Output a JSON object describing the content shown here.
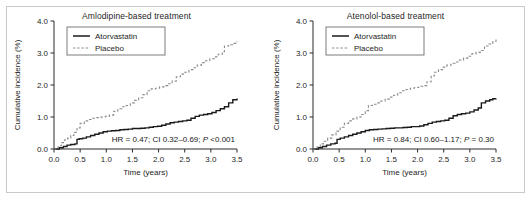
{
  "figure": {
    "border_color": "#c9c9c9",
    "background": "#ffffff"
  },
  "chart_data": [
    {
      "type": "line",
      "panel": "left",
      "title": "Amlodipine-based treatment",
      "xlabel": "Time (years)",
      "ylabel": "Cumulative incidence (%)",
      "xlim": [
        0.0,
        3.5
      ],
      "ylim": [
        0.0,
        4.0
      ],
      "xticks": [
        "0.0",
        "0.5",
        "1.0",
        "1.5",
        "2.0",
        "2.5",
        "3.0",
        "3.5"
      ],
      "yticks": [
        "0.0",
        "1.0",
        "2.0",
        "3.0",
        "4.0"
      ],
      "grid": false,
      "legend_position": "top-left",
      "annotation": "HR = 0.47; CI 0.32–0.69; P <0.001",
      "annotation_parts": {
        "pre": "HR = 0.47; CI 0.32–0.69; ",
        "italic": "P",
        "post": " <0.001"
      },
      "hazard_ratio": 0.47,
      "ci_low": 0.32,
      "ci_high": 0.69,
      "p_value": "<0.001",
      "series": [
        {
          "name": "Atorvastatin",
          "style": "solid",
          "color": "#1a1a1a",
          "x": [
            0.0,
            0.1,
            0.18,
            0.25,
            0.32,
            0.4,
            0.44,
            0.48,
            0.55,
            0.62,
            0.7,
            0.78,
            0.86,
            0.94,
            1.02,
            1.1,
            1.18,
            1.26,
            1.34,
            1.42,
            1.5,
            1.58,
            1.66,
            1.74,
            1.82,
            1.9,
            1.98,
            2.06,
            2.14,
            2.22,
            2.3,
            2.38,
            2.46,
            2.54,
            2.62,
            2.7,
            2.78,
            2.86,
            2.94,
            3.02,
            3.1,
            3.18,
            3.26,
            3.34,
            3.42,
            3.5
          ],
          "y": [
            0.0,
            0.04,
            0.08,
            0.12,
            0.14,
            0.16,
            0.3,
            0.32,
            0.34,
            0.38,
            0.42,
            0.46,
            0.5,
            0.54,
            0.56,
            0.57,
            0.58,
            0.6,
            0.61,
            0.62,
            0.64,
            0.64,
            0.65,
            0.66,
            0.68,
            0.7,
            0.71,
            0.74,
            0.78,
            0.82,
            0.84,
            0.86,
            0.88,
            0.9,
            0.96,
            1.02,
            1.06,
            1.08,
            1.1,
            1.14,
            1.2,
            1.26,
            1.32,
            1.44,
            1.54,
            1.58
          ]
        },
        {
          "name": "Placebo",
          "style": "dashed",
          "color": "#8c8c8c",
          "x": [
            0.0,
            0.08,
            0.14,
            0.2,
            0.26,
            0.32,
            0.38,
            0.44,
            0.5,
            0.58,
            0.66,
            0.74,
            0.82,
            0.9,
            0.98,
            1.06,
            1.14,
            1.22,
            1.3,
            1.38,
            1.46,
            1.54,
            1.62,
            1.7,
            1.78,
            1.86,
            1.94,
            2.02,
            2.1,
            2.18,
            2.26,
            2.34,
            2.42,
            2.5,
            2.58,
            2.66,
            2.74,
            2.82,
            2.9,
            2.98,
            3.06,
            3.14,
            3.22,
            3.26,
            3.34,
            3.42,
            3.5
          ],
          "y": [
            0.0,
            0.1,
            0.2,
            0.28,
            0.34,
            0.42,
            0.52,
            0.66,
            0.8,
            0.88,
            0.92,
            0.96,
            0.98,
            1.0,
            1.02,
            1.06,
            1.18,
            1.26,
            1.32,
            1.36,
            1.44,
            1.52,
            1.6,
            1.7,
            1.82,
            1.88,
            1.9,
            1.94,
            1.98,
            2.04,
            2.12,
            2.26,
            2.34,
            2.4,
            2.48,
            2.54,
            2.62,
            2.7,
            2.76,
            2.82,
            2.88,
            2.96,
            3.04,
            3.22,
            3.26,
            3.3,
            3.36
          ]
        }
      ]
    },
    {
      "type": "line",
      "panel": "right",
      "title": "Atenolol-based treatment",
      "xlabel": "Time (years)",
      "ylabel": "Cumulative incidence (%)",
      "xlim": [
        0.0,
        3.5
      ],
      "ylim": [
        0.0,
        4.0
      ],
      "xticks": [
        "0.0",
        "0.5",
        "1.0",
        "1.5",
        "2.0",
        "2.5",
        "3.0",
        "3.5"
      ],
      "yticks": [
        "0.0",
        "1.0",
        "2.0",
        "3.0",
        "4.0"
      ],
      "grid": false,
      "legend_position": "top-left",
      "annotation": "HR = 0.84; CI 0.60–1.17; P = 0.30",
      "annotation_parts": {
        "pre": "HR = 0.84; CI 0.60–1.17; ",
        "italic": "P",
        "post": " = 0.30"
      },
      "hazard_ratio": 0.84,
      "ci_low": 0.6,
      "ci_high": 1.17,
      "p_value": "0.30",
      "series": [
        {
          "name": "Atorvastatin",
          "style": "solid",
          "color": "#1a1a1a",
          "x": [
            0.0,
            0.1,
            0.18,
            0.26,
            0.34,
            0.42,
            0.46,
            0.52,
            0.6,
            0.68,
            0.76,
            0.84,
            0.92,
            1.0,
            1.08,
            1.16,
            1.24,
            1.32,
            1.4,
            1.48,
            1.56,
            1.64,
            1.72,
            1.8,
            1.88,
            1.96,
            2.04,
            2.12,
            2.2,
            2.28,
            2.36,
            2.44,
            2.52,
            2.6,
            2.68,
            2.76,
            2.84,
            2.92,
            3.0,
            3.08,
            3.16,
            3.22,
            3.3,
            3.38,
            3.44,
            3.5
          ],
          "y": [
            0.0,
            0.04,
            0.08,
            0.12,
            0.16,
            0.18,
            0.3,
            0.34,
            0.38,
            0.42,
            0.46,
            0.5,
            0.54,
            0.58,
            0.6,
            0.61,
            0.62,
            0.63,
            0.64,
            0.65,
            0.66,
            0.66,
            0.67,
            0.68,
            0.7,
            0.7,
            0.72,
            0.76,
            0.8,
            0.84,
            0.86,
            0.88,
            0.9,
            0.96,
            1.04,
            1.08,
            1.1,
            1.12,
            1.16,
            1.22,
            1.28,
            1.44,
            1.5,
            1.54,
            1.57,
            1.58
          ]
        },
        {
          "name": "Placebo",
          "style": "dashed",
          "color": "#8c8c8c",
          "x": [
            0.0,
            0.08,
            0.14,
            0.2,
            0.28,
            0.36,
            0.44,
            0.52,
            0.6,
            0.68,
            0.76,
            0.84,
            0.92,
            1.0,
            1.06,
            1.14,
            1.22,
            1.3,
            1.38,
            1.46,
            1.54,
            1.62,
            1.7,
            1.78,
            1.86,
            1.94,
            2.02,
            2.1,
            2.18,
            2.26,
            2.32,
            2.4,
            2.48,
            2.56,
            2.64,
            2.72,
            2.8,
            2.88,
            2.96,
            3.04,
            3.12,
            3.2,
            3.28,
            3.36,
            3.44,
            3.5
          ],
          "y": [
            0.0,
            0.08,
            0.16,
            0.24,
            0.34,
            0.44,
            0.56,
            0.68,
            0.8,
            0.88,
            0.94,
            1.0,
            1.08,
            1.2,
            1.36,
            1.4,
            1.44,
            1.5,
            1.56,
            1.62,
            1.68,
            1.76,
            1.82,
            1.86,
            1.9,
            1.92,
            1.96,
            1.98,
            2.1,
            2.28,
            2.4,
            2.48,
            2.56,
            2.62,
            2.68,
            2.72,
            2.78,
            2.84,
            2.9,
            2.98,
            3.02,
            3.08,
            3.22,
            3.28,
            3.36,
            3.44
          ]
        }
      ]
    }
  ]
}
